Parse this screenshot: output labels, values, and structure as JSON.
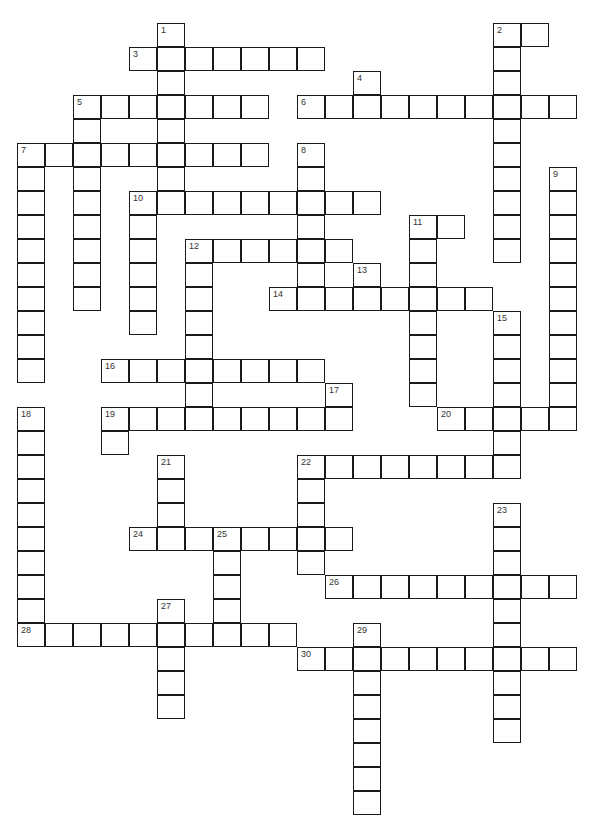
{
  "puzzle": {
    "type": "crossword",
    "cell_width": 28,
    "cell_height": 24,
    "origin_x": 17,
    "origin_y": 23,
    "line_color": "#1a1a1a",
    "entries": [
      {
        "number": 1,
        "dir": "down",
        "row": 0,
        "col": 5,
        "length": 8
      },
      {
        "number": 2,
        "dir": "across",
        "row": 0,
        "col": 17,
        "length": 2
      },
      {
        "number": 2,
        "dir": "down",
        "row": 0,
        "col": 17,
        "length": 10
      },
      {
        "number": 3,
        "dir": "across",
        "row": 1,
        "col": 4,
        "length": 7
      },
      {
        "number": 4,
        "dir": "down",
        "row": 2,
        "col": 12,
        "length": 2
      },
      {
        "number": 5,
        "dir": "across",
        "row": 3,
        "col": 2,
        "length": 7
      },
      {
        "number": 5,
        "dir": "down",
        "row": 3,
        "col": 2,
        "length": 9
      },
      {
        "number": 6,
        "dir": "across",
        "row": 3,
        "col": 10,
        "length": 10
      },
      {
        "number": 7,
        "dir": "across",
        "row": 5,
        "col": 0,
        "length": 9
      },
      {
        "number": 7,
        "dir": "down",
        "row": 5,
        "col": 0,
        "length": 10
      },
      {
        "number": 8,
        "dir": "down",
        "row": 5,
        "col": 10,
        "length": 7
      },
      {
        "number": 9,
        "dir": "down",
        "row": 6,
        "col": 19,
        "length": 11
      },
      {
        "number": 10,
        "dir": "across",
        "row": 7,
        "col": 4,
        "length": 9
      },
      {
        "number": 10,
        "dir": "down",
        "row": 7,
        "col": 4,
        "length": 6
      },
      {
        "number": 11,
        "dir": "across",
        "row": 8,
        "col": 14,
        "length": 2
      },
      {
        "number": 11,
        "dir": "down",
        "row": 8,
        "col": 14,
        "length": 8
      },
      {
        "number": 12,
        "dir": "across",
        "row": 9,
        "col": 6,
        "length": 6
      },
      {
        "number": 12,
        "dir": "down",
        "row": 9,
        "col": 6,
        "length": 8
      },
      {
        "number": 13,
        "dir": "down",
        "row": 10,
        "col": 12,
        "length": 2
      },
      {
        "number": 14,
        "dir": "across",
        "row": 11,
        "col": 9,
        "length": 8
      },
      {
        "number": 15,
        "dir": "down",
        "row": 12,
        "col": 17,
        "length": 7
      },
      {
        "number": 16,
        "dir": "across",
        "row": 14,
        "col": 3,
        "length": 8
      },
      {
        "number": 17,
        "dir": "down",
        "row": 15,
        "col": 11,
        "length": 2
      },
      {
        "number": 18,
        "dir": "down",
        "row": 16,
        "col": 0,
        "length": 10
      },
      {
        "number": 19,
        "dir": "across",
        "row": 16,
        "col": 3,
        "length": 9
      },
      {
        "number": 19,
        "dir": "down",
        "row": 16,
        "col": 3,
        "length": 2
      },
      {
        "number": 20,
        "dir": "across",
        "row": 16,
        "col": 15,
        "length": 5
      },
      {
        "number": 21,
        "dir": "down",
        "row": 18,
        "col": 5,
        "length": 4
      },
      {
        "number": 22,
        "dir": "across",
        "row": 18,
        "col": 10,
        "length": 8
      },
      {
        "number": 22,
        "dir": "down",
        "row": 18,
        "col": 10,
        "length": 5
      },
      {
        "number": 23,
        "dir": "down",
        "row": 20,
        "col": 17,
        "length": 10
      },
      {
        "number": 24,
        "dir": "across",
        "row": 21,
        "col": 4,
        "length": 8
      },
      {
        "number": 25,
        "dir": "down",
        "row": 21,
        "col": 7,
        "length": 5
      },
      {
        "number": 26,
        "dir": "across",
        "row": 23,
        "col": 11,
        "length": 9
      },
      {
        "number": 27,
        "dir": "down",
        "row": 24,
        "col": 5,
        "length": 5
      },
      {
        "number": 28,
        "dir": "across",
        "row": 25,
        "col": 0,
        "length": 10
      },
      {
        "number": 29,
        "dir": "down",
        "row": 25,
        "col": 12,
        "length": 8
      },
      {
        "number": 30,
        "dir": "across",
        "row": 26,
        "col": 10,
        "length": 10
      }
    ]
  }
}
